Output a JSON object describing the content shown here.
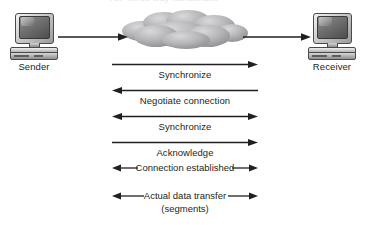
{
  "figure": {
    "title_ghost": "TCP three-way handshake",
    "background_color": "#ffffff",
    "ink_color": "#231f20"
  },
  "endpoints": {
    "sender": {
      "label": "Sender",
      "icon": "desktop-computer-icon"
    },
    "receiver": {
      "label": "Receiver",
      "icon": "desktop-computer-icon"
    }
  },
  "network": {
    "icon": "network-cloud-icon",
    "label": "",
    "color": "#a7a7a9"
  },
  "links": [
    {
      "name": "sender-to-cloud",
      "direction": "right"
    },
    {
      "name": "cloud-to-receiver",
      "direction": "right"
    }
  ],
  "messages": [
    {
      "label": "Synchronize",
      "direction": "right",
      "style": "label-below"
    },
    {
      "label": "Negotiate connection",
      "direction": "left",
      "style": "label-below"
    },
    {
      "label": "Synchronize",
      "direction": "both",
      "style": "label-below"
    },
    {
      "label": "Acknowledge",
      "direction": "right",
      "style": "label-below"
    },
    {
      "label": "Connection established",
      "direction": "both",
      "style": "label-inline"
    },
    {
      "label": "Actual data transfer",
      "sublabel": "(segments)",
      "direction": "both",
      "style": "label-inline"
    }
  ]
}
